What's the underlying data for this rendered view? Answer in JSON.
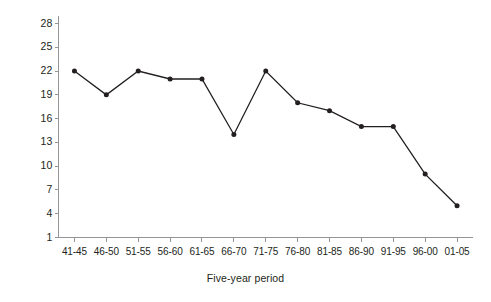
{
  "chart_data": {
    "type": "line",
    "title": "",
    "subtitle": "",
    "xlabel": "Five-year period",
    "ylabel": "April",
    "categories": [
      "41-45",
      "46-50",
      "51-55",
      "56-60",
      "61-65",
      "66-70",
      "71-75",
      "76-80",
      "81-85",
      "86-90",
      "91-95",
      "96-00",
      "01-05"
    ],
    "values": [
      22,
      19,
      22,
      21,
      21,
      14,
      22,
      18,
      17,
      15,
      15,
      9,
      5
    ],
    "series": [
      {
        "name": "April",
        "values": [
          22,
          19,
          22,
          21,
          21,
          14,
          22,
          18,
          17,
          15,
          15,
          9,
          5
        ]
      }
    ],
    "ylim": [
      1,
      29
    ],
    "yticks": [
      1,
      4,
      7,
      10,
      13,
      16,
      19,
      22,
      25,
      28
    ],
    "ytick_labels": [
      "1",
      "4",
      "7",
      "10",
      "13",
      "16",
      "19",
      "22",
      "25",
      "28"
    ],
    "grid": false,
    "legend": false,
    "legend_position": "none",
    "marker": "filled-circle",
    "line_color": "#231f20",
    "marker_color": "#231f20",
    "axis_color": "#939598",
    "background": "#ffffff"
  }
}
